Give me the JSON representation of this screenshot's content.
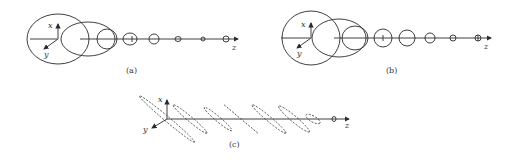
{
  "panels": [
    {
      "id": "a",
      "caption": "(a)",
      "axes": {
        "x": "x",
        "y": "y",
        "z": "z"
      },
      "description": "Sequence of decreasing ellipses along z axis"
    },
    {
      "id": "b",
      "caption": "(b)",
      "axes": {
        "x": "x",
        "y": "y",
        "z": "z"
      },
      "description": "Sequence of decreasing circles along z axis"
    },
    {
      "id": "c",
      "caption": "(c)",
      "axes": {
        "x": "x",
        "y": "y",
        "z": "z"
      },
      "description": "Sequence of dashed slanted ellipses along z axis"
    }
  ]
}
